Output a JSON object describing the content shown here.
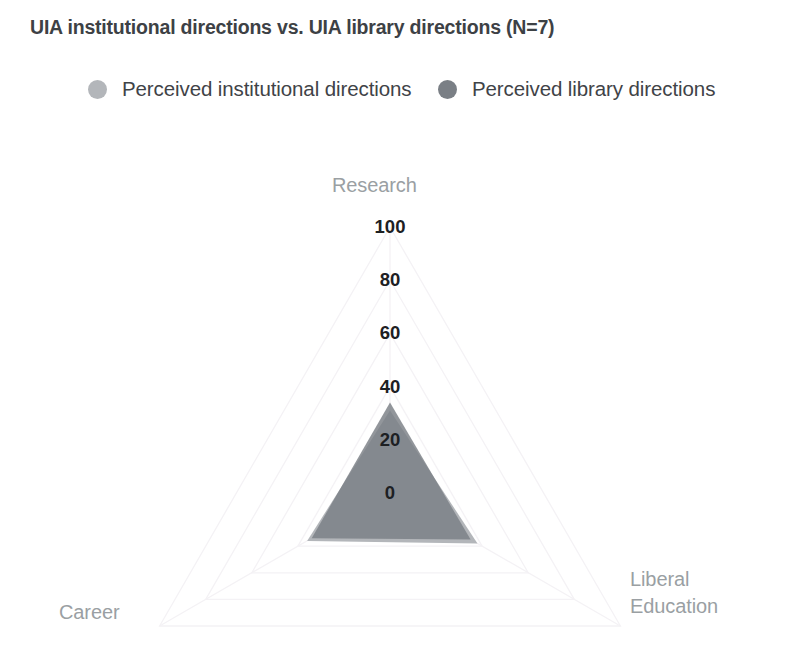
{
  "chart_data": {
    "type": "radar",
    "title": "UIA institutional directions vs. UIA library directions (N=7)",
    "axes": [
      "Research",
      "Liberal Education",
      "Career"
    ],
    "tick_labels": [
      "0",
      "20",
      "40",
      "60",
      "80",
      "100"
    ],
    "tick_values": [
      0,
      20,
      40,
      60,
      80,
      100
    ],
    "rlim": [
      0,
      100
    ],
    "grid": true,
    "grid_color": "#f4f2f5",
    "legend_position": "top",
    "series": [
      {
        "name": "Perceived institutional directions",
        "color": "#b3b6ba",
        "values": [
          31,
          38,
          36
        ]
      },
      {
        "name": "Perceived library directions",
        "color": "#7a7f85",
        "values": [
          34,
          35,
          34
        ]
      }
    ],
    "axis_label_color": "#9a9fa3",
    "tick_label_color": "#1d2023",
    "background": "#ffffff"
  }
}
